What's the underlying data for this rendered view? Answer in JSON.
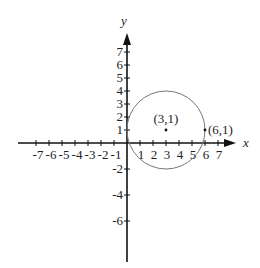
{
  "axes": {
    "x_label": "x",
    "y_label": "y",
    "x_ticks": [
      "-7",
      "-6",
      "-5",
      "-4",
      "-3",
      "-2",
      "-1",
      "1",
      "2",
      "3",
      "4",
      "5",
      "6",
      "7"
    ],
    "y_ticks_positive": [
      "7",
      "6",
      "5",
      "4",
      "3",
      "2",
      "1"
    ],
    "y_ticks_negative": [
      "-2",
      "-4",
      "-6"
    ]
  },
  "circle": {
    "center_label": "(3,1)",
    "point_label": "(6,1)",
    "center": [
      3,
      1
    ],
    "radius": 3
  },
  "colors": {
    "axis": "#111111",
    "circle": "#777777",
    "text": "#222222"
  }
}
